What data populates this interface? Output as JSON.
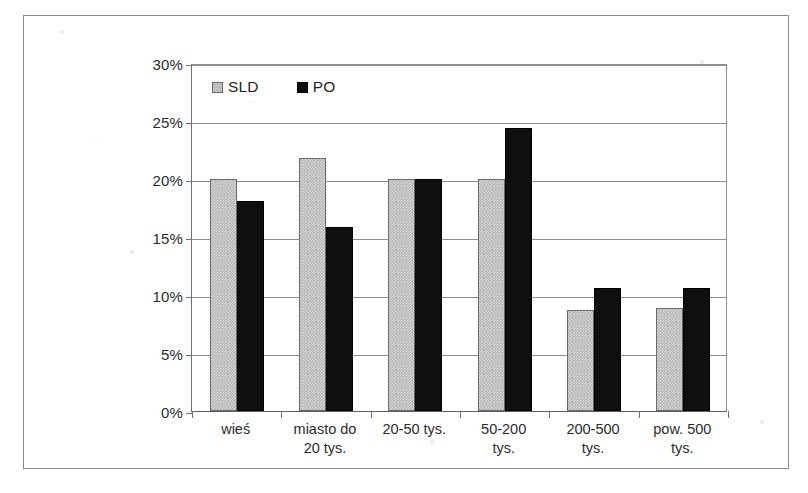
{
  "chart_data": {
    "type": "bar",
    "title": "",
    "subtitle": "",
    "xlabel": "",
    "ylabel": "",
    "ylim": [
      0,
      30
    ],
    "ytick_labels": [
      "0%",
      "5%",
      "10%",
      "15%",
      "20%",
      "25%",
      "30%"
    ],
    "ytick_values": [
      0,
      5,
      10,
      15,
      20,
      25,
      30
    ],
    "y_unit": "%",
    "grid": "horizontal",
    "legend_position": "top-left-inside",
    "categories": [
      "wieś",
      "miasto do 20 tys.",
      "20-50 tys.",
      "50-200 tys.",
      "200-500 tys.",
      "pow. 500 tys."
    ],
    "category_lines": [
      [
        "wieś"
      ],
      [
        "miasto do",
        "20 tys."
      ],
      [
        "20-50 tys."
      ],
      [
        "50-200",
        "tys."
      ],
      [
        "200-500",
        "tys."
      ],
      [
        "pow. 500",
        "tys."
      ]
    ],
    "series": [
      {
        "name": "SLD",
        "color": "#b7b7b7",
        "values": [
          20.0,
          21.8,
          20.0,
          20.0,
          8.7,
          8.9
        ]
      },
      {
        "name": "PO",
        "color": "#100f0f",
        "values": [
          18.1,
          15.9,
          20.0,
          24.4,
          10.6,
          10.6
        ]
      }
    ]
  },
  "legend": {
    "items": [
      {
        "label": "SLD",
        "swatch": "light-gray-hatched"
      },
      {
        "label": "PO",
        "swatch": "black-solid"
      }
    ]
  }
}
